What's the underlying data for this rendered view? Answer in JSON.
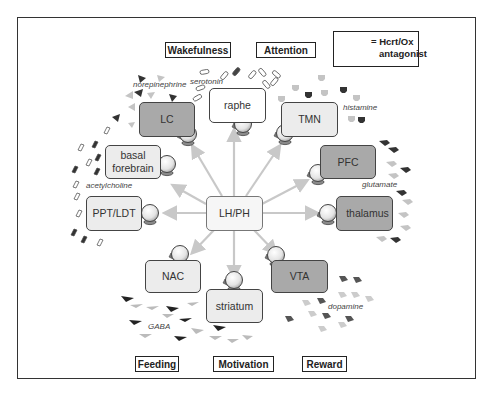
{
  "legend": {
    "line1": "= Hcrt/Ox",
    "line2": "antagonist",
    "icon": "antagonist-ball-icon"
  },
  "functions": {
    "wakefulness": "Wakefulness",
    "attention": "Attention",
    "feeding": "Feeding",
    "motivation": "Motivation",
    "reward": "Reward"
  },
  "nodes": {
    "center": "LH/PH",
    "raphe": "raphe",
    "lc": "LC",
    "tmn": "TMN",
    "basal_forebrain_1": "basal",
    "basal_forebrain_2": "forebrain",
    "pfc": "PFC",
    "ppt_ldt": "PPT/LDT",
    "thalamus": "thalamus",
    "nac": "NAC",
    "vta": "VTA",
    "striatum": "striatum"
  },
  "neurotransmitters": {
    "norepinephrine": "norepinephrine",
    "serotonin": "serotonin",
    "histamine": "histamine",
    "glutamate": "glutamate",
    "acetylcholine": "acetylcholine",
    "dopamine": "dopamine",
    "gaba": "GABA"
  },
  "colors": {
    "arrow": "#c8c8c8",
    "node_light": "#ececec",
    "node_dark": "#a9a9a9",
    "molecule_dark": "#333333",
    "molecule_light": "#c4c4c4"
  }
}
